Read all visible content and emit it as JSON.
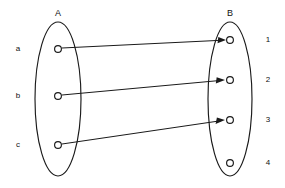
{
  "diagram": {
    "title_left": "A",
    "title_right": "B",
    "colors": {
      "stroke": "#1a1a1a",
      "text": "#111111",
      "background": "#ffffff"
    }
  },
  "set_a": {
    "label": "A",
    "label_x": 58,
    "label_y": 16,
    "ellipse": {
      "cx": 58,
      "cy": 99,
      "rx": 23,
      "ry": 77
    },
    "elements": [
      {
        "id": "a",
        "label": "a",
        "node_x": 58,
        "node_y": 49,
        "label_x": 18,
        "label_y": 49
      },
      {
        "id": "b",
        "label": "b",
        "node_x": 58,
        "node_y": 96,
        "label_x": 18,
        "label_y": 96
      },
      {
        "id": "c",
        "label": "c",
        "node_x": 58,
        "node_y": 145,
        "label_x": 18,
        "label_y": 145
      }
    ]
  },
  "set_b": {
    "label": "B",
    "label_x": 230,
    "label_y": 16,
    "ellipse": {
      "cx": 230,
      "cy": 99,
      "rx": 22,
      "ry": 77
    },
    "elements": [
      {
        "id": "1",
        "label": "1",
        "node_x": 230,
        "node_y": 40,
        "label_x": 268,
        "label_y": 40
      },
      {
        "id": "2",
        "label": "2",
        "node_x": 230,
        "node_y": 80,
        "label_x": 268,
        "label_y": 80
      },
      {
        "id": "3",
        "label": "3",
        "node_x": 230,
        "node_y": 120,
        "label_x": 268,
        "label_y": 120
      },
      {
        "id": "4",
        "label": "4",
        "node_x": 230,
        "node_y": 163,
        "label_x": 268,
        "label_y": 163
      }
    ]
  },
  "node_radius": 3.4,
  "mappings": [
    {
      "id": "a-to-1",
      "from": "a",
      "to": "1",
      "x1": 62,
      "y1": 48,
      "x2": 225,
      "y2": 40
    },
    {
      "id": "b-to-2",
      "from": "b",
      "to": "2",
      "x1": 62,
      "y1": 95,
      "x2": 224,
      "y2": 80
    },
    {
      "id": "c-to-3",
      "from": "c",
      "to": "3",
      "x1": 62,
      "y1": 144,
      "x2": 224,
      "y2": 120
    }
  ],
  "unmapped_targets": [
    "4"
  ]
}
